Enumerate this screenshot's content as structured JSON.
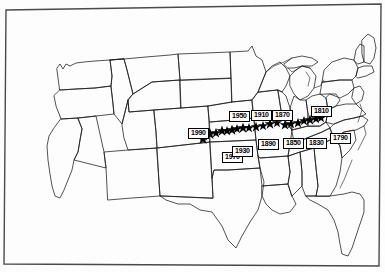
{
  "figure": {
    "kind": "thematic-map",
    "background_color": "#ffffff",
    "outline_color": "#000000",
    "marker_color": "#000000",
    "marker_symbol": "star",
    "label_box_fill": "#ffffff",
    "label_box_border": "#000000"
  },
  "map_data": {
    "type": "point-series-on-map",
    "region": "United States (conterminous)",
    "series_name": "Mean center of population",
    "marker": "star",
    "labeled_points": [
      {
        "year": "1790",
        "label": "1790",
        "x": 330,
        "y": 133,
        "star_x": 321,
        "star_y": 118
      },
      {
        "year": "1800",
        "label": "",
        "x": 0,
        "y": 0,
        "star_x": 316,
        "star_y": 119
      },
      {
        "year": "1810",
        "label": "1810",
        "x": 311,
        "y": 106,
        "star_x": 310,
        "star_y": 120
      },
      {
        "year": "1820",
        "label": "",
        "x": 0,
        "y": 0,
        "star_x": 304,
        "star_y": 121
      },
      {
        "year": "1830",
        "label": "1830",
        "x": 306,
        "y": 138,
        "star_x": 298,
        "star_y": 123
      },
      {
        "year": "1840",
        "label": "",
        "x": 0,
        "y": 0,
        "star_x": 291,
        "star_y": 124
      },
      {
        "year": "1850",
        "label": "1850",
        "x": 283,
        "y": 138,
        "star_x": 285,
        "star_y": 125
      },
      {
        "year": "1860",
        "label": "",
        "x": 0,
        "y": 0,
        "star_x": 277,
        "star_y": 123
      },
      {
        "year": "1870",
        "label": "1870",
        "x": 272,
        "y": 110,
        "star_x": 270,
        "star_y": 124
      },
      {
        "year": "1880",
        "label": "",
        "x": 0,
        "y": 0,
        "star_x": 263,
        "star_y": 126
      },
      {
        "year": "1890",
        "label": "1890",
        "x": 258,
        "y": 139,
        "star_x": 256,
        "star_y": 127
      },
      {
        "year": "1900",
        "label": "",
        "x": 0,
        "y": 0,
        "star_x": 249,
        "star_y": 128
      },
      {
        "year": "1910",
        "label": "1910",
        "x": 251,
        "y": 110,
        "star_x": 243,
        "star_y": 128
      },
      {
        "year": "1920",
        "label": "",
        "x": 0,
        "y": 0,
        "star_x": 237,
        "star_y": 129
      },
      {
        "year": "1930",
        "label": "1930",
        "x": 232,
        "y": 146,
        "star_x": 232,
        "star_y": 130
      },
      {
        "year": "1940",
        "label": "",
        "x": 0,
        "y": 0,
        "star_x": 227,
        "star_y": 131
      },
      {
        "year": "1950",
        "label": "1950",
        "x": 229,
        "y": 111,
        "star_x": 222,
        "star_y": 131
      },
      {
        "year": "1960",
        "label": "",
        "x": 0,
        "y": 0,
        "star_x": 216,
        "star_y": 133
      },
      {
        "year": "1970",
        "label": "1970",
        "x": 222,
        "y": 152,
        "star_x": 210,
        "star_y": 134
      },
      {
        "year": "1980",
        "label": "",
        "x": 0,
        "y": 0,
        "star_x": 204,
        "star_y": 136
      },
      {
        "year": "1990",
        "label": "1990",
        "x": 188,
        "y": 128,
        "star_x": 203,
        "star_y": 139
      }
    ],
    "label_order_left_to_right": [
      "1990",
      "1970",
      "1930",
      "1950",
      "1910",
      "1890",
      "1870",
      "1850",
      "1830",
      "1810",
      "1790"
    ]
  }
}
